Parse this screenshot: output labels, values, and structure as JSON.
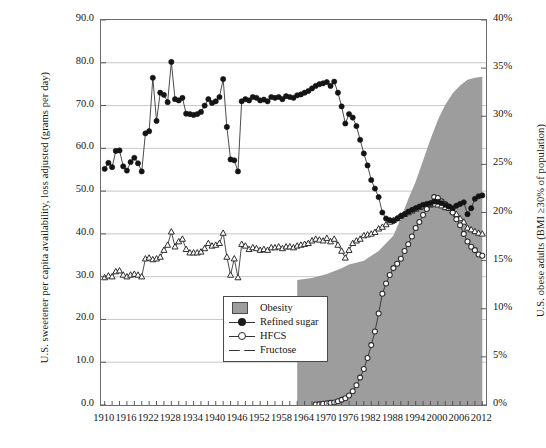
{
  "chart_data": {
    "type": "line",
    "title": "",
    "subtitle": "",
    "xlabel": "",
    "ylabel": "U.S. sweetener per capita availability, loss adjusted (grams per day)",
    "ylabel_right": "U.S. obese adults (BMI ≥30% of population)",
    "xlim": [
      1909,
      2013
    ],
    "ylim": [
      0.0,
      90.0
    ],
    "ylim_right": [
      0,
      40
    ],
    "grid": true,
    "legend_position": "inner-left-lower",
    "x_tick_labels": [
      "1910",
      "1916",
      "1922",
      "1928",
      "1934",
      "1940",
      "1946",
      "1952",
      "1958",
      "1964",
      "1970",
      "1976",
      "1982",
      "1988",
      "1994",
      "2000",
      "2006",
      "2012"
    ],
    "x_tick_values": [
      1910,
      1916,
      1922,
      1928,
      1934,
      1940,
      1946,
      1952,
      1958,
      1964,
      1970,
      1976,
      1982,
      1988,
      1994,
      2000,
      2006,
      2012
    ],
    "y_tick_labels": [
      "0.0",
      "10.0",
      "20.0",
      "30.0",
      "40.0",
      "50.0",
      "60.0",
      "70.0",
      "80.0",
      "90.0"
    ],
    "y_tick_values": [
      0,
      10,
      20,
      30,
      40,
      50,
      60,
      70,
      80,
      90
    ],
    "y_right_tick_labels": [
      "0%",
      "5%",
      "10%",
      "15%",
      "20%",
      "25%",
      "30%",
      "35%",
      "40%"
    ],
    "y_right_tick_values": [
      0,
      5,
      10,
      15,
      20,
      25,
      30,
      35,
      40
    ],
    "legend": [
      {
        "label": "Obesity",
        "marker": "area-swatch",
        "color": "#9d9d9d"
      },
      {
        "label": "Refined sugar",
        "marker": "filled-circle",
        "color": "#1b1b1b"
      },
      {
        "label": "HFCS",
        "marker": "open-circle",
        "color": "#2b2b2b"
      },
      {
        "label": "Fructose",
        "marker": "open-triangle",
        "color": "#2b2b2b"
      }
    ],
    "series": [
      {
        "name": "Obesity",
        "axis": "right",
        "type": "area",
        "color": "#9d9d9d",
        "x": [
          1962,
          1966,
          1970,
          1974,
          1976,
          1980,
          1984,
          1988,
          1990,
          1992,
          1994,
          1996,
          1998,
          2000,
          2002,
          2004,
          2006,
          2008,
          2010,
          2012
        ],
        "values": [
          13.0,
          13.2,
          13.6,
          14.2,
          14.6,
          15.0,
          16.0,
          17.6,
          19.4,
          21.4,
          23.2,
          25.4,
          27.6,
          29.6,
          31.2,
          32.4,
          33.2,
          33.8,
          34.0,
          34.1
        ]
      },
      {
        "name": "Refined sugar",
        "axis": "left",
        "type": "line",
        "color": "#1b1b1b",
        "x": [
          1910,
          1911,
          1912,
          1913,
          1914,
          1915,
          1916,
          1917,
          1918,
          1919,
          1920,
          1921,
          1922,
          1923,
          1924,
          1925,
          1926,
          1927,
          1928,
          1929,
          1930,
          1931,
          1932,
          1933,
          1934,
          1935,
          1936,
          1937,
          1938,
          1939,
          1940,
          1941,
          1942,
          1943,
          1944,
          1945,
          1946,
          1947,
          1948,
          1949,
          1950,
          1951,
          1952,
          1953,
          1954,
          1955,
          1956,
          1957,
          1958,
          1959,
          1960,
          1961,
          1962,
          1963,
          1964,
          1965,
          1966,
          1967,
          1968,
          1969,
          1970,
          1971,
          1972,
          1973,
          1974,
          1975,
          1976,
          1977,
          1978,
          1979,
          1980,
          1981,
          1982,
          1983,
          1984,
          1985,
          1986,
          1987,
          1988,
          1989,
          1990,
          1991,
          1992,
          1993,
          1994,
          1995,
          1996,
          1997,
          1998,
          1999,
          2000,
          2001,
          2002,
          2003,
          2004,
          2005,
          2006,
          2007,
          2008,
          2009,
          2010,
          2011,
          2012
        ],
        "values": [
          55.2,
          56.6,
          55.6,
          59.4,
          59.5,
          55.8,
          54.8,
          56.8,
          57.8,
          56.5,
          54.6,
          63.5,
          64.0,
          76.5,
          66.4,
          73.0,
          72.5,
          70.8,
          80.2,
          71.5,
          71.2,
          71.8,
          68.1,
          68.0,
          67.8,
          68.0,
          68.5,
          70.0,
          71.5,
          70.6,
          71.0,
          72.0,
          76.2,
          65.0,
          57.4,
          57.2,
          54.6,
          71.0,
          71.5,
          71.2,
          72.0,
          71.8,
          71.2,
          71.4,
          71.0,
          72.0,
          71.8,
          72.0,
          71.5,
          72.2,
          72.0,
          71.8,
          72.4,
          72.6,
          73.0,
          73.4,
          74.0,
          74.6,
          75.0,
          75.2,
          75.5,
          74.6,
          75.6,
          73.0,
          69.8,
          65.8,
          68.0,
          67.2,
          65.2,
          62.0,
          58.8,
          56.0,
          52.6,
          50.6,
          48.6,
          45.0,
          43.6,
          43.2,
          43.0,
          43.6,
          44.2,
          44.6,
          45.2,
          45.6,
          46.0,
          46.4,
          46.8,
          47.0,
          47.2,
          47.6,
          47.5,
          47.2,
          46.8,
          46.4,
          46.0,
          46.6,
          47.0,
          47.4,
          44.6,
          46.0,
          48.2,
          48.8,
          49.0
        ]
      },
      {
        "name": "HFCS",
        "axis": "left",
        "type": "line",
        "color": "#2b2b2b",
        "x": [
          1967,
          1968,
          1969,
          1970,
          1971,
          1972,
          1973,
          1974,
          1975,
          1976,
          1977,
          1978,
          1979,
          1980,
          1981,
          1982,
          1983,
          1984,
          1985,
          1986,
          1987,
          1988,
          1989,
          1990,
          1991,
          1992,
          1993,
          1994,
          1995,
          1996,
          1997,
          1998,
          1999,
          2000,
          2001,
          2002,
          2003,
          2004,
          2005,
          2006,
          2007,
          2008,
          2009,
          2010,
          2011,
          2012
        ],
        "values": [
          0.1,
          0.2,
          0.3,
          0.4,
          0.5,
          0.6,
          0.9,
          1.2,
          1.6,
          2.2,
          3.2,
          4.6,
          6.4,
          8.4,
          11.0,
          14.0,
          17.2,
          21.4,
          26.0,
          28.4,
          30.4,
          32.0,
          33.0,
          34.2,
          36.0,
          37.6,
          39.4,
          41.4,
          42.8,
          44.4,
          45.8,
          47.0,
          48.6,
          48.4,
          47.6,
          47.0,
          46.4,
          45.0,
          43.4,
          42.0,
          40.0,
          38.2,
          37.0,
          36.2,
          35.2,
          34.9
        ]
      },
      {
        "name": "Fructose",
        "axis": "left",
        "type": "line",
        "color": "#2b2b2b",
        "x": [
          1910,
          1911,
          1912,
          1913,
          1914,
          1915,
          1916,
          1917,
          1918,
          1919,
          1920,
          1921,
          1922,
          1923,
          1924,
          1925,
          1926,
          1927,
          1928,
          1929,
          1930,
          1931,
          1932,
          1933,
          1934,
          1935,
          1936,
          1937,
          1938,
          1939,
          1940,
          1941,
          1942,
          1943,
          1944,
          1945,
          1946,
          1947,
          1948,
          1949,
          1950,
          1951,
          1952,
          1953,
          1954,
          1955,
          1956,
          1957,
          1958,
          1959,
          1960,
          1961,
          1962,
          1963,
          1964,
          1965,
          1966,
          1967,
          1968,
          1969,
          1970,
          1971,
          1972,
          1973,
          1974,
          1975,
          1976,
          1977,
          1978,
          1979,
          1980,
          1981,
          1982,
          1983,
          1984,
          1985,
          1986,
          1987,
          1988,
          1989,
          1990,
          1991,
          1992,
          1993,
          1994,
          1995,
          1996,
          1997,
          1998,
          1999,
          2000,
          2001,
          2002,
          2003,
          2004,
          2005,
          2006,
          2007,
          2008,
          2009,
          2010,
          2011,
          2012
        ],
        "values": [
          29.8,
          30.2,
          30.0,
          31.2,
          31.4,
          30.4,
          30.0,
          30.4,
          30.6,
          30.4,
          30.0,
          34.2,
          34.4,
          34.0,
          34.2,
          34.6,
          36.2,
          37.4,
          40.5,
          37.0,
          38.2,
          38.8,
          36.4,
          35.6,
          35.6,
          35.6,
          35.8,
          36.6,
          37.8,
          37.2,
          37.4,
          37.8,
          40.2,
          34.6,
          30.4,
          34.2,
          29.8,
          37.6,
          37.2,
          36.4,
          36.8,
          36.6,
          36.2,
          36.4,
          36.2,
          36.8,
          36.8,
          37.0,
          36.6,
          37.0,
          37.0,
          36.8,
          37.2,
          37.4,
          37.6,
          37.8,
          38.4,
          38.8,
          38.6,
          38.4,
          39.0,
          38.2,
          38.8,
          37.4,
          36.0,
          34.4,
          36.2,
          37.8,
          38.4,
          38.8,
          39.6,
          39.8,
          40.0,
          40.4,
          41.2,
          41.6,
          42.2,
          42.8,
          43.2,
          43.6,
          44.2,
          44.6,
          45.0,
          45.4,
          45.8,
          46.2,
          46.4,
          46.6,
          46.8,
          47.0,
          46.8,
          46.6,
          46.2,
          46.0,
          45.4,
          44.6,
          43.6,
          42.8,
          41.4,
          41.0,
          40.6,
          40.2,
          40.0
        ]
      }
    ]
  }
}
